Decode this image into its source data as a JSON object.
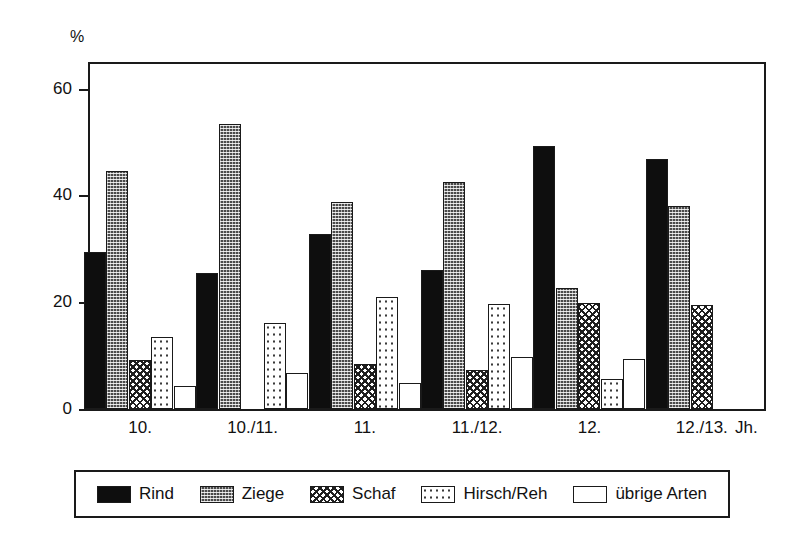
{
  "chart_data": {
    "type": "bar",
    "title": "",
    "subtitle": "",
    "xlabel": "Jh.",
    "ylabel": "%",
    "ylim": [
      0,
      65
    ],
    "yticks": [
      0,
      20,
      40,
      60
    ],
    "ytick_labels": [
      "0",
      "20",
      "40",
      "60"
    ],
    "grid": false,
    "legend_position": "bottom",
    "categories": [
      "10.",
      "10./11.",
      "11.",
      "11./12.",
      "12.",
      "12./13."
    ],
    "series": [
      {
        "name": "Rind",
        "pattern": "solid-black",
        "values": [
          29.5,
          25.5,
          32.8,
          26.0,
          49.2,
          46.8
        ]
      },
      {
        "name": "Ziege",
        "pattern": "dense-dark-dots",
        "values": [
          44.5,
          53.3,
          38.8,
          42.5,
          22.7,
          38.0
        ]
      },
      {
        "name": "Schaf",
        "pattern": "crosshatch",
        "values": [
          9.2,
          null,
          8.4,
          7.3,
          19.8,
          19.4
        ]
      },
      {
        "name": "Hirsch/Reh",
        "pattern": "light-dots",
        "values": [
          13.4,
          16.2,
          21.0,
          19.6,
          5.6,
          null
        ]
      },
      {
        "name": "übrige Arten",
        "pattern": "white",
        "values": [
          4.4,
          6.8,
          4.9,
          9.7,
          9.4,
          null
        ]
      }
    ]
  },
  "axis": {
    "unit_label": "%",
    "x_unit_label": "Jh."
  },
  "legend": {
    "items": [
      {
        "label": "Rind",
        "swatch": "solid-black-swatch"
      },
      {
        "label": "Ziege",
        "swatch": "dense-dark-dots-swatch"
      },
      {
        "label": "Schaf",
        "swatch": "crosshatch-swatch"
      },
      {
        "label": "Hirsch/Reh",
        "swatch": "light-dots-swatch"
      },
      {
        "label": "übrige Arten",
        "swatch": "white-swatch"
      }
    ]
  },
  "colors": {
    "axis": "#1a1a1a",
    "background": "#ffffff",
    "rind": "#0e0e0e",
    "ziege": "#4a4a4a",
    "schaf": "#1f1f1f",
    "hirsch": "#3a3a3a",
    "uebrige": "#ffffff"
  }
}
